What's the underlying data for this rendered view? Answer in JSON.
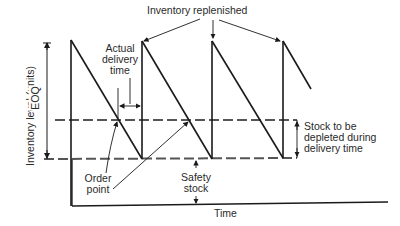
{
  "diagram": {
    "y_axis_label": "Inventory level (units)",
    "x_axis_label": "Time",
    "eoq_label": "EOQ",
    "annotations": {
      "inventory_replenished": "Inventory replenished",
      "actual_delivery_time_line1": "Actual",
      "actual_delivery_time_line2": "delivery",
      "actual_delivery_time_line3": "time",
      "order_point_line1": "Order",
      "order_point_line2": "point",
      "safety_stock_line1": "Safety",
      "safety_stock_line2": "stock",
      "stock_depleted_line1": "Stock to be",
      "stock_depleted_line2": "depleted during",
      "stock_depleted_line3": "delivery time"
    },
    "levels": {
      "peak_y": 41,
      "order_point_y": 120,
      "safety_stock_y": 159,
      "axis_y": 205
    },
    "replenishment_x": [
      71,
      142,
      212,
      283
    ],
    "colors": {
      "line": "#1a1a1a",
      "dashed": "#555555",
      "text": "#2a2a2a"
    }
  }
}
